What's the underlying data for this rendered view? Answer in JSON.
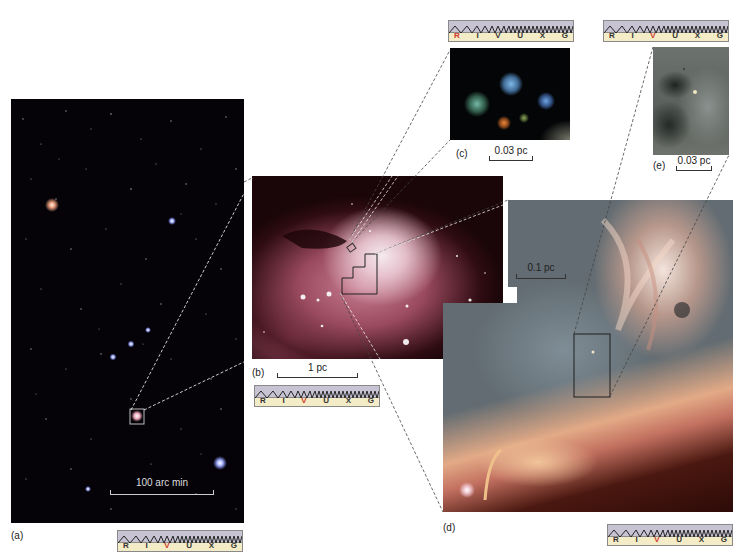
{
  "figure": {
    "panels": {
      "a": {
        "label": "(a)",
        "scale": "100 arc min",
        "highlight_band": "V"
      },
      "b": {
        "label": "(b)",
        "scale": "1 pc",
        "highlight_band": "V"
      },
      "c": {
        "label": "(c)",
        "scale": "0.03 pc",
        "highlight_band": "R"
      },
      "d": {
        "label": "(d)",
        "scale": "0.1 pc",
        "highlight_band": "V"
      },
      "e": {
        "label": "(e)",
        "scale": "0.03 pc",
        "highlight_band": "V"
      }
    },
    "spectrum_bands": [
      "R",
      "I",
      "V",
      "U",
      "X",
      "G"
    ],
    "colors": {
      "highlight": "#d0382a",
      "spectrum_wave_bg": "#c7c3d3",
      "spectrum_label_bg": "#f3ecc6",
      "starfield_bg": "#050308",
      "nebula_pink": "#b86a7e"
    }
  }
}
